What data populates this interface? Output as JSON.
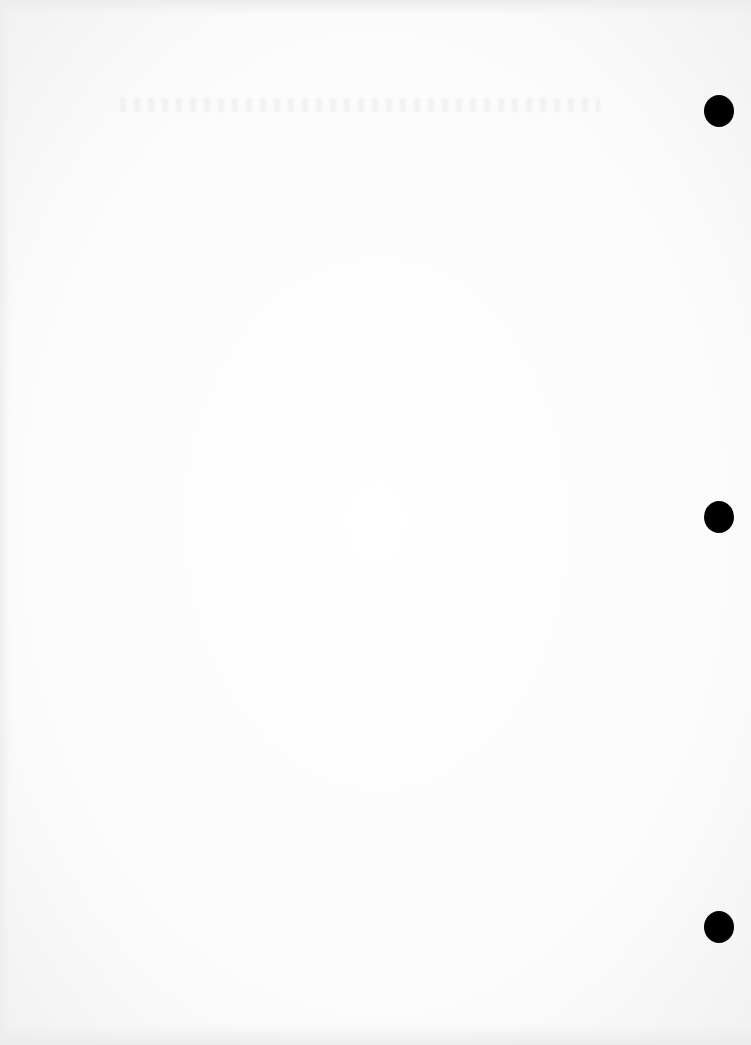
{
  "document": {
    "type": "blank scanned page",
    "text_content": "",
    "punch_holes": [
      {
        "x": 719,
        "y": 111
      },
      {
        "x": 719,
        "y": 517
      },
      {
        "x": 719,
        "y": 927
      }
    ],
    "colors": {
      "paper": "#fbfbfb",
      "hole": "#000000"
    }
  }
}
